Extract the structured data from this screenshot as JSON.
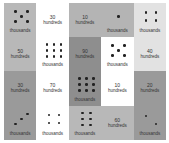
{
  "colors": {
    "grey": "#bcbcbc",
    "light": "#dedede",
    "dark": "#9c9c9c",
    "white": "#ffffff"
  },
  "tiles": [
    {
      "id": "t1",
      "col": 0,
      "row": 0,
      "orient": "v",
      "color": "#b8b8b8",
      "cells": [
        {
          "type": "dots",
          "count": 5,
          "label": "thousands"
        },
        {
          "type": "num",
          "value": "50",
          "label": "hundreds"
        }
      ]
    },
    {
      "id": "t2",
      "col": 1,
      "row": 0,
      "orient": "v",
      "color": "#ffffff",
      "cells": [
        {
          "type": "num",
          "value": "30",
          "label": "hundreds"
        },
        {
          "type": "dots",
          "count": 9,
          "label": "thousands"
        }
      ]
    },
    {
      "id": "t3",
      "col": 2,
      "row": 0,
      "orient": "h",
      "color": "#b4b4b4",
      "cells": [
        {
          "type": "num",
          "value": "10",
          "label": "hundreds"
        },
        {
          "type": "dots",
          "count": 1,
          "label": "thousands"
        }
      ]
    },
    {
      "id": "t4",
      "col": 4,
      "row": 0,
      "orient": "v",
      "color": "#e2e2e2",
      "cells": [
        {
          "type": "dots",
          "count": 4,
          "label": "thousands"
        },
        {
          "type": "num",
          "value": "40",
          "label": "hundreds"
        }
      ]
    },
    {
      "id": "t5",
      "col": 2,
      "row": 1,
      "orient": "v",
      "color": "#8e8e8e",
      "cells": [
        {
          "type": "num",
          "value": "90",
          "label": "hundreds"
        },
        {
          "type": "dots",
          "count": 9,
          "label": "thousands"
        }
      ]
    },
    {
      "id": "t6",
      "col": 3,
      "row": 1,
      "orient": "v",
      "color": "#ffffff",
      "cells": [
        {
          "type": "dots",
          "count": 5,
          "label": "thousands"
        },
        {
          "type": "num",
          "value": "10",
          "label": "hundreds"
        }
      ]
    },
    {
      "id": "t7",
      "col": 0,
      "row": 2,
      "orient": "v",
      "color": "#9a9a9a",
      "cells": [
        {
          "type": "num",
          "value": "30",
          "label": "hundreds"
        },
        {
          "type": "dots",
          "count": 3,
          "label": "thousands"
        }
      ]
    },
    {
      "id": "t8",
      "col": 1,
      "row": 2,
      "orient": "v",
      "color": "#ffffff",
      "cells": [
        {
          "type": "num",
          "value": "70",
          "label": "hundreds"
        },
        {
          "type": "dots",
          "count": 4,
          "label": "thousands"
        }
      ]
    },
    {
      "id": "t9",
      "col": 4,
      "row": 2,
      "orient": "v",
      "color": "#9a9a9a",
      "cells": [
        {
          "type": "num",
          "value": "20",
          "label": "hundreds"
        },
        {
          "type": "dots",
          "count": 2,
          "label": "thousands"
        }
      ]
    },
    {
      "id": "t10",
      "col": 2,
      "row": 3,
      "orient": "h",
      "color": "#b8b8b8",
      "cells": [
        {
          "type": "dots",
          "count": 6,
          "label": "thousands"
        },
        {
          "type": "num",
          "value": "60",
          "label": "hundreds"
        }
      ]
    }
  ]
}
